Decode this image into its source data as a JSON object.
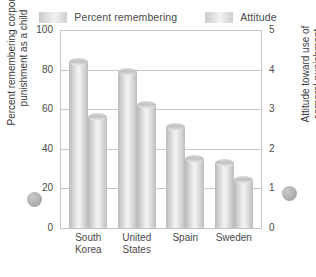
{
  "legend": {
    "position": "top-center",
    "entries": [
      {
        "label": "Percent remembering",
        "swatch_name": "legend-swatch-percent-remembering"
      },
      {
        "label": "Attitude",
        "swatch_name": "legend-swatch-attitude"
      }
    ]
  },
  "left_axis": {
    "title": "Percent remembering corporal\npunishment as a child",
    "ticks": [
      "0",
      "20",
      "40",
      "60",
      "80",
      "100"
    ]
  },
  "right_axis": {
    "title": "Attitude toward use of\ncorporal punishment",
    "ticks": [
      "0",
      "1",
      "2",
      "3",
      "4",
      "5"
    ]
  },
  "colors": {
    "bar_light": "#f4f4f4",
    "bar_mid": "#cfcfcf",
    "bar_dark": "#b9b9b9",
    "gridline": "#c6c6c6",
    "text": "#4a4a4a",
    "axis_dot": "#adadad"
  },
  "chart_data": {
    "type": "bar",
    "title": "",
    "subtitle": "",
    "xlabel": "",
    "ylabel": "Percent remembering corporal punishment as a child",
    "y2label": "Attitude toward use of corporal punishment",
    "categories": [
      "South Korea",
      "United States",
      "Spain",
      "Sweden"
    ],
    "series": [
      {
        "name": "Percent remembering",
        "axis": "left",
        "values": [
          84,
          79,
          51,
          33
        ],
        "units": "percent"
      },
      {
        "name": "Attitude",
        "axis": "right",
        "values": [
          2.8,
          3.1,
          1.75,
          1.2
        ],
        "units": "rating"
      }
    ],
    "ylim": [
      0,
      100
    ],
    "y2lim": [
      0,
      5
    ],
    "yticks": [
      0,
      20,
      40,
      60,
      80,
      100
    ],
    "y2ticks": [
      0,
      1,
      2,
      3,
      4,
      5
    ],
    "grid": true,
    "legend_position": "top-center"
  }
}
